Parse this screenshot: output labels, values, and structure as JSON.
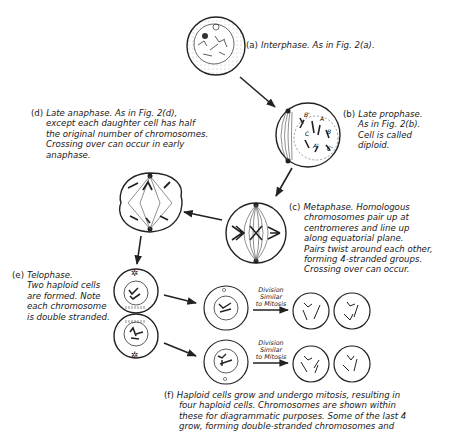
{
  "figure": {
    "stages": {
      "a": {
        "tag": "(a)",
        "lines": [
          "Interphase. As in Fig. 2(a)."
        ]
      },
      "b": {
        "tag": "(b)",
        "lines": [
          "Late prophase.",
          "As in Fig. 2(b).",
          "Cell is called",
          "diploid."
        ]
      },
      "c": {
        "tag": "(c)",
        "lines": [
          "Metaphase. Homologous",
          "chromosomes pair up at",
          "centromeres and line up",
          "along equatorial plane.",
          "Pairs twist around each other,",
          "forming 4-stranded groups.",
          "Crossing over can occur."
        ]
      },
      "d": {
        "tag": "(d)",
        "lines": [
          "Late anaphase. As in Fig. 2(d),",
          "except each daughter cell has half",
          "the original number of chromosomes.",
          "Crossing over can occur in early",
          "anaphase."
        ]
      },
      "e": {
        "tag": "(e)",
        "lines": [
          "Telophase.",
          "Two haploid cells",
          "are formed. Note",
          "each chromosome",
          "is double stranded."
        ]
      },
      "f": {
        "tag": "(f)",
        "lines": [
          "Haploid cells grow and undergo mitosis, resulting in",
          "four haploid cells. Chromosomes are shown within",
          "these for diagrammatic purposes. Some of the last 4",
          "grow, forming double-stranded chromosomes and"
        ]
      }
    },
    "arrow_labels": {
      "top": [
        "Division",
        "Similar",
        "to Mitosis"
      ],
      "bottom": [
        "Division",
        "Similar",
        "to Mitosis"
      ]
    },
    "chromosome_labels": [
      "B'",
      "A",
      "B",
      "C",
      "A'",
      "C'"
    ]
  }
}
